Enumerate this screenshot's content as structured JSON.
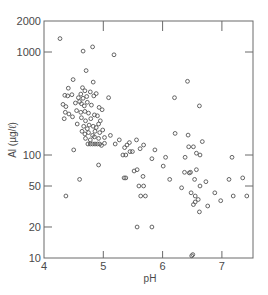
{
  "chart_data": {
    "type": "scatter",
    "title": "",
    "xlabel": "pH",
    "ylabel": "Al (µg/ℓ)",
    "xlim": [
      4,
      7.52
    ],
    "ylim": [
      10,
      2000
    ],
    "yscale": "log",
    "grid": false,
    "legend": null,
    "x_ticks": [
      4,
      5,
      6,
      7
    ],
    "x_tick_labels": [
      "4",
      "5",
      "6",
      "7"
    ],
    "y_ticks": [
      10,
      20,
      50,
      100,
      1000,
      2000
    ],
    "y_tick_labels": [
      "10",
      "20",
      "50",
      "100",
      "1000",
      "2000"
    ],
    "marker": "open-circle",
    "series": [
      {
        "name": "samples",
        "points": [
          [
            4.27,
            1350
          ],
          [
            4.66,
            1020
          ],
          [
            4.82,
            1120
          ],
          [
            5.18,
            940
          ],
          [
            4.71,
            660
          ],
          [
            4.49,
            540
          ],
          [
            4.83,
            510
          ],
          [
            4.41,
            445
          ],
          [
            4.65,
            450
          ],
          [
            4.69,
            420
          ],
          [
            4.78,
            410
          ],
          [
            4.88,
            395
          ],
          [
            5.09,
            360
          ],
          [
            4.35,
            380
          ],
          [
            4.4,
            375
          ],
          [
            4.47,
            385
          ],
          [
            4.62,
            390
          ],
          [
            4.58,
            360
          ],
          [
            4.66,
            355
          ],
          [
            4.72,
            370
          ],
          [
            4.84,
            375
          ],
          [
            4.32,
            310
          ],
          [
            4.37,
            295
          ],
          [
            4.53,
            320
          ],
          [
            4.6,
            330
          ],
          [
            4.63,
            315
          ],
          [
            4.68,
            300
          ],
          [
            4.73,
            325
          ],
          [
            4.8,
            305
          ],
          [
            4.93,
            290
          ],
          [
            4.36,
            260
          ],
          [
            4.42,
            250
          ],
          [
            4.55,
            270
          ],
          [
            4.62,
            260
          ],
          [
            4.69,
            265
          ],
          [
            4.75,
            255
          ],
          [
            4.85,
            245
          ],
          [
            4.98,
            275
          ],
          [
            4.34,
            225
          ],
          [
            4.48,
            235
          ],
          [
            4.63,
            230
          ],
          [
            4.7,
            215
          ],
          [
            4.79,
            225
          ],
          [
            4.9,
            240
          ],
          [
            4.95,
            215
          ],
          [
            4.56,
            200
          ],
          [
            4.67,
            190
          ],
          [
            4.73,
            180
          ],
          [
            4.76,
            195
          ],
          [
            4.83,
            190
          ],
          [
            4.88,
            185
          ],
          [
            4.92,
            200
          ],
          [
            4.64,
            170
          ],
          [
            4.69,
            160
          ],
          [
            4.75,
            165
          ],
          [
            4.82,
            155
          ],
          [
            4.86,
            170
          ],
          [
            4.94,
            165
          ],
          [
            4.99,
            175
          ],
          [
            4.7,
            145
          ],
          [
            4.78,
            140
          ],
          [
            4.85,
            150
          ],
          [
            4.92,
            145
          ],
          [
            5.02,
            148
          ],
          [
            5.12,
            155
          ],
          [
            4.74,
            128
          ],
          [
            4.78,
            128
          ],
          [
            4.82,
            128
          ],
          [
            4.86,
            128
          ],
          [
            4.9,
            128
          ],
          [
            4.94,
            128
          ],
          [
            4.97,
            124
          ],
          [
            5.02,
            130
          ],
          [
            5.2,
            128
          ],
          [
            5.27,
            140
          ],
          [
            5.36,
            118
          ],
          [
            5.4,
            125
          ],
          [
            5.44,
            132
          ],
          [
            5.56,
            140
          ],
          [
            5.68,
            125
          ],
          [
            4.5,
            112
          ],
          [
            5.33,
            100
          ],
          [
            5.38,
            100
          ],
          [
            5.45,
            108
          ],
          [
            5.49,
            108
          ],
          [
            5.62,
            115
          ],
          [
            5.87,
            112
          ],
          [
            6.21,
            162
          ],
          [
            6.43,
            156
          ],
          [
            6.44,
            120
          ],
          [
            6.52,
            120
          ],
          [
            6.67,
            135
          ],
          [
            4.92,
            80
          ],
          [
            5.52,
            70
          ],
          [
            5.57,
            72
          ],
          [
            5.82,
            92
          ],
          [
            6.05,
            95
          ],
          [
            6.38,
            95
          ],
          [
            6.57,
            104
          ],
          [
            6.63,
            100
          ],
          [
            7.17,
            95
          ],
          [
            4.6,
            58
          ],
          [
            5.35,
            60
          ],
          [
            5.38,
            60
          ],
          [
            5.67,
            62
          ],
          [
            6.01,
            78
          ],
          [
            6.37,
            68
          ],
          [
            6.47,
            68
          ],
          [
            6.57,
            72
          ],
          [
            5.6,
            50
          ],
          [
            5.68,
            50
          ],
          [
            6.12,
            58
          ],
          [
            6.45,
            67
          ],
          [
            6.54,
            58
          ],
          [
            6.63,
            50
          ],
          [
            6.73,
            55
          ],
          [
            7.12,
            58
          ],
          [
            7.35,
            60
          ],
          [
            4.37,
            40
          ],
          [
            5.63,
            40
          ],
          [
            5.71,
            40
          ],
          [
            6.32,
            48
          ],
          [
            6.48,
            43
          ],
          [
            6.55,
            40
          ],
          [
            6.6,
            37
          ],
          [
            6.88,
            43
          ],
          [
            6.52,
            33
          ],
          [
            6.55,
            35
          ],
          [
            6.76,
            32
          ],
          [
            6.98,
            36
          ],
          [
            7.19,
            40
          ],
          [
            7.42,
            40
          ],
          [
            6.62,
            28
          ],
          [
            5.57,
            20
          ],
          [
            5.82,
            20
          ],
          [
            6.49,
            10.5
          ],
          [
            6.51,
            10.8
          ],
          [
            6.42,
            520
          ],
          [
            6.2,
            360
          ],
          [
            6.62,
            300
          ]
        ]
      }
    ]
  }
}
